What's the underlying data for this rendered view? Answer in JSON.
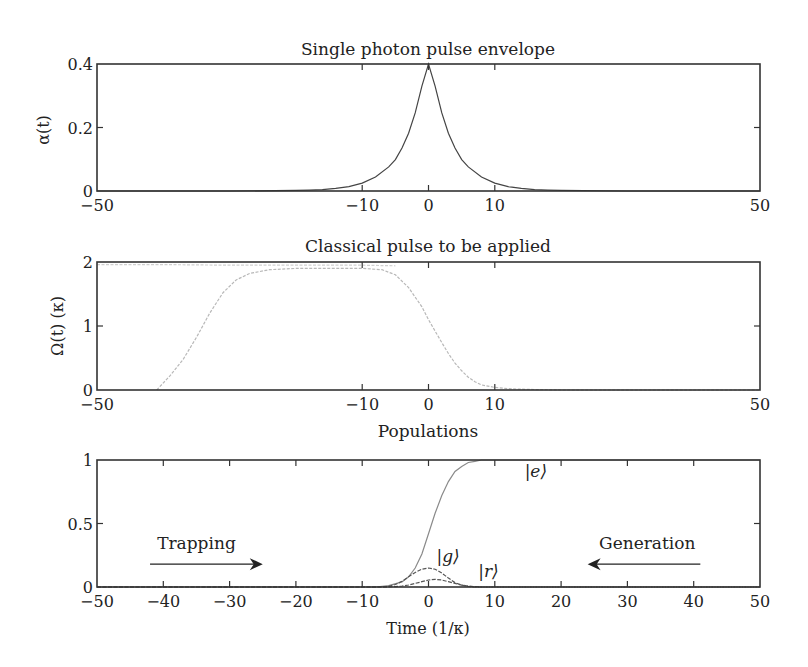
{
  "figure": {
    "background": "#ffffff",
    "ink_color": "#222222"
  },
  "chart_data": [
    {
      "id": "envelope",
      "type": "line",
      "title": "Single photon pulse envelope",
      "xlabel": "",
      "ylabel": "α(t)",
      "xlim": [
        -50,
        50
      ],
      "ylim": [
        0,
        0.4
      ],
      "xticks": [
        -50,
        -10,
        0,
        10,
        50
      ],
      "xtick_labels": [
        "−50",
        "−10",
        "0",
        "10",
        "50"
      ],
      "yticks": [
        0,
        0.2,
        0.4
      ],
      "ytick_labels": [
        "0",
        "0.2",
        "0.4"
      ],
      "grid": false,
      "series": [
        {
          "name": "α(t)",
          "color": "#444444",
          "x": [
            -50,
            -30,
            -20,
            -18,
            -16,
            -14,
            -12,
            -10,
            -8,
            -6,
            -5,
            -4,
            -3,
            -2,
            -1,
            0,
            1,
            2,
            3,
            4,
            5,
            6,
            8,
            10,
            12,
            14,
            16,
            18,
            20,
            30,
            50
          ],
          "y": [
            0,
            0,
            0.002,
            0.0027,
            0.0045,
            0.0081,
            0.014,
            0.025,
            0.044,
            0.076,
            0.099,
            0.135,
            0.182,
            0.246,
            0.33,
            0.4,
            0.33,
            0.246,
            0.182,
            0.135,
            0.099,
            0.076,
            0.044,
            0.025,
            0.014,
            0.0081,
            0.0045,
            0.0027,
            0.002,
            0,
            0
          ]
        }
      ]
    },
    {
      "id": "classical",
      "type": "line",
      "title": "Classical pulse to be applied",
      "xlabel": "",
      "ylabel": "Ω(t) (κ)",
      "xlim": [
        -50,
        50
      ],
      "ylim": [
        0,
        2
      ],
      "xticks": [
        -50,
        -10,
        0,
        10,
        50
      ],
      "xtick_labels": [
        "−50",
        "−10",
        "0",
        "10",
        "50"
      ],
      "yticks": [
        0,
        1,
        2
      ],
      "ytick_labels": [
        "0",
        "1",
        "2"
      ],
      "grid": false,
      "series": [
        {
          "name": "Ω(t)",
          "color": "#b8b8b8",
          "x": [
            -41,
            -39,
            -37,
            -35,
            -33,
            -31,
            -29,
            -27,
            -24,
            -20,
            -15,
            -10,
            -7,
            -5,
            -3,
            -1,
            0,
            1,
            2,
            3,
            4,
            5,
            6,
            7,
            8,
            10,
            12,
            15,
            20,
            30,
            50
          ],
          "y": [
            0.0,
            0.22,
            0.48,
            0.82,
            1.2,
            1.52,
            1.72,
            1.82,
            1.88,
            1.9,
            1.9,
            1.9,
            1.88,
            1.8,
            1.6,
            1.3,
            1.1,
            0.92,
            0.74,
            0.57,
            0.42,
            0.3,
            0.2,
            0.13,
            0.08,
            0.04,
            0.02,
            0.01,
            0.0,
            0.0,
            0.0
          ]
        },
        {
          "name": "Ω(t) faint upper trace",
          "color": "#cfcfcf",
          "x": [
            -50,
            -40,
            -30,
            -20,
            -10,
            -5
          ],
          "y": [
            1.96,
            1.96,
            1.95,
            1.95,
            1.95,
            1.94
          ]
        }
      ]
    },
    {
      "id": "populations",
      "type": "line",
      "title": "Populations",
      "xlabel": "Time (1/κ)",
      "ylabel": "",
      "xlim": [
        -50,
        50
      ],
      "ylim": [
        0,
        1
      ],
      "xticks": [
        -50,
        -40,
        -30,
        -20,
        -10,
        0,
        10,
        20,
        30,
        40,
        50
      ],
      "xtick_labels": [
        "−50",
        "−40",
        "−30",
        "−20",
        "−10",
        "0",
        "10",
        "20",
        "30",
        "40",
        "50"
      ],
      "yticks": [
        0,
        0.5,
        1
      ],
      "ytick_labels": [
        "0",
        "0.5",
        "1"
      ],
      "grid": false,
      "series": [
        {
          "name": "|e⟩",
          "color": "#8a8a8a",
          "x": [
            -50,
            -8,
            -6,
            -4,
            -3,
            -2,
            -1,
            0,
            1,
            2,
            3,
            4,
            5,
            6,
            7,
            8,
            9,
            50
          ],
          "y": [
            0,
            0,
            0.01,
            0.04,
            0.08,
            0.15,
            0.26,
            0.42,
            0.58,
            0.72,
            0.83,
            0.91,
            0.95,
            0.98,
            0.99,
            1.0,
            1.0,
            1.0
          ]
        },
        {
          "name": "|g⟩",
          "color": "#555555",
          "x": [
            -50,
            -7,
            -6,
            -5,
            -4,
            -3,
            -2,
            -1,
            0,
            1,
            2,
            3,
            4,
            5,
            6,
            7,
            50
          ],
          "y": [
            0,
            0,
            0.005,
            0.02,
            0.045,
            0.08,
            0.115,
            0.14,
            0.15,
            0.14,
            0.11,
            0.07,
            0.035,
            0.015,
            0.005,
            0,
            0
          ]
        },
        {
          "name": "|r⟩",
          "color": "#555555",
          "x": [
            -50,
            -6,
            -5,
            -4,
            -3,
            -2,
            -1,
            0,
            1,
            2,
            3,
            4,
            5,
            6,
            7,
            8,
            50
          ],
          "y": [
            0,
            0,
            0.003,
            0.008,
            0.016,
            0.028,
            0.042,
            0.055,
            0.06,
            0.055,
            0.042,
            0.028,
            0.015,
            0.007,
            0.002,
            0,
            0
          ]
        }
      ],
      "annotations": [
        {
          "id": "label_e",
          "text": "|e⟩",
          "x": 14.5,
          "y": 0.87
        },
        {
          "id": "label_g",
          "text": "|g⟩",
          "x": 1.2,
          "y": 0.2
        },
        {
          "id": "label_r",
          "text": "|r⟩",
          "x": 7.5,
          "y": 0.08
        },
        {
          "id": "trapping",
          "text": "Trapping",
          "x": -35,
          "y": 0.3
        },
        {
          "id": "generation",
          "text": "Generation",
          "x": 33,
          "y": 0.3
        }
      ],
      "arrows": [
        {
          "id": "trapping_arrow",
          "from": [
            -42,
            0.18
          ],
          "to": [
            -25,
            0.18
          ],
          "direction": "right"
        },
        {
          "id": "generation_arrow",
          "from": [
            41,
            0.18
          ],
          "to": [
            24,
            0.18
          ],
          "direction": "left"
        }
      ]
    }
  ],
  "layout": {
    "plot_left": 97,
    "plot_right": 760,
    "panels": [
      {
        "top": 64,
        "bottom": 191
      },
      {
        "top": 262,
        "bottom": 390
      },
      {
        "top": 460,
        "bottom": 587
      }
    ]
  }
}
